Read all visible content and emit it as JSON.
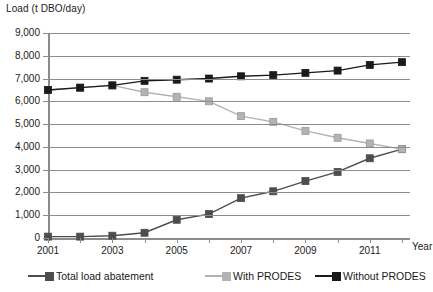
{
  "chart_data": {
    "type": "line",
    "title": "",
    "ylabel": "Load (t DBO/day)",
    "xlabel": "Year",
    "ylim": [
      0,
      9000
    ],
    "ytick_labels": [
      "9,000",
      "8,000",
      "7,000",
      "6,000",
      "5,000",
      "4,000",
      "3,000",
      "2,000",
      "1,000",
      "0"
    ],
    "ytick_values": [
      9000,
      8000,
      7000,
      6000,
      5000,
      4000,
      3000,
      2000,
      1000,
      0
    ],
    "x": [
      2001,
      2002,
      2003,
      2004,
      2005,
      2006,
      2007,
      2008,
      2009,
      2010,
      2011,
      2012
    ],
    "xtick_labels": [
      "2001",
      "",
      "2003",
      "",
      "2005",
      "",
      "2007",
      "",
      "2009",
      "",
      "2011",
      ""
    ],
    "xlim": [
      2001,
      2012
    ],
    "grid": true,
    "legend_position": "bottom",
    "series": [
      {
        "name": "Total load abatement",
        "color": "#4d4d4d",
        "values": [
          60,
          60,
          100,
          230,
          800,
          1050,
          1750,
          2050,
          2500,
          2900,
          3500,
          3900
        ]
      },
      {
        "name": "With PRODES",
        "color": "#b3b3b3",
        "values": [
          6500,
          6600,
          6700,
          6400,
          6200,
          6000,
          5350,
          5100,
          4700,
          4400,
          4150,
          3900
        ]
      },
      {
        "name": "Without PRODES",
        "color": "#1a1a1a",
        "values": [
          6500,
          6600,
          6700,
          6900,
          6950,
          7000,
          7100,
          7150,
          7250,
          7350,
          7600,
          7720
        ]
      }
    ]
  },
  "legend": {
    "items": [
      {
        "label": "Total load abatement",
        "color": "#4d4d4d"
      },
      {
        "label": "With PRODES",
        "color": "#b3b3b3"
      },
      {
        "label": "Without PRODES",
        "color": "#1a1a1a"
      }
    ]
  }
}
